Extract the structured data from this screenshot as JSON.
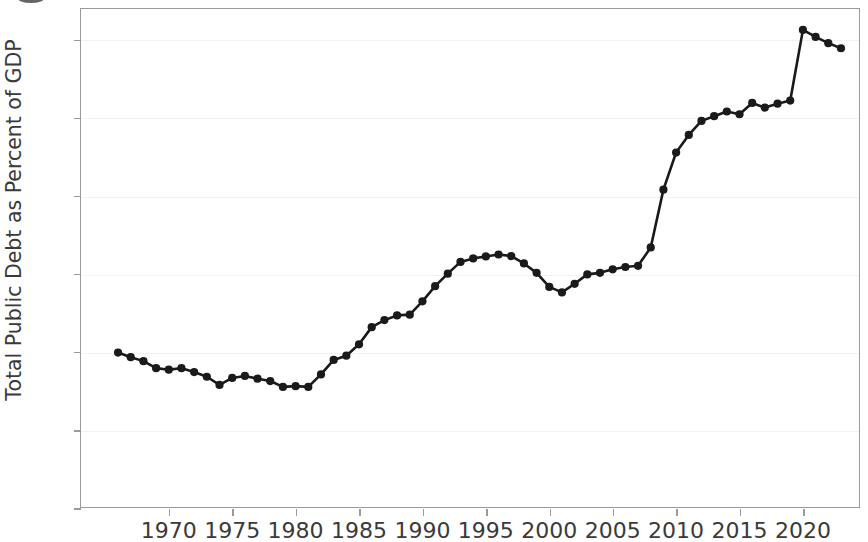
{
  "chart_data": {
    "type": "line",
    "title": "",
    "subtitle": "",
    "xlabel": "",
    "ylabel": "Total Public Debt as Percent of GDP",
    "xlim": [
      1963.0,
      2024.5
    ],
    "ylim": [
      0,
      128
    ],
    "xticks": [
      1970,
      1975,
      1980,
      1985,
      1990,
      1995,
      2000,
      2005,
      2010,
      2015,
      2020
    ],
    "xtick_labels": [
      "1970",
      "1975",
      "1980",
      "1985",
      "1990",
      "1995",
      "2000",
      "2005",
      "2010",
      "2015",
      "2020"
    ],
    "yticks": [
      0,
      20,
      40,
      60,
      80,
      100,
      120
    ],
    "ytick_labels": [
      "0",
      "20",
      "40",
      "60",
      "80",
      "100",
      "120"
    ],
    "grid": true,
    "grid_axis": "y",
    "legend": false,
    "legend_position": "none",
    "marker": "circle",
    "line_color": "#1a1a1a",
    "marker_color": "#1a1a1a",
    "series": [
      {
        "name": "Total Public Debt as Percent of GDP",
        "x": [
          1966,
          1967,
          1968,
          1969,
          1970,
          1971,
          1972,
          1973,
          1974,
          1975,
          1976,
          1977,
          1978,
          1979,
          1980,
          1981,
          1982,
          1983,
          1984,
          1985,
          1986,
          1987,
          1988,
          1989,
          1990,
          1991,
          1992,
          1993,
          1994,
          1995,
          1996,
          1997,
          1998,
          1999,
          2000,
          2001,
          2002,
          2003,
          2004,
          2005,
          2006,
          2007,
          2008,
          2009,
          2010,
          2011,
          2012,
          2013,
          2014,
          2015,
          2016,
          2017,
          2018,
          2019,
          2020,
          2021,
          2022,
          2023
        ],
        "values": [
          39.8,
          38.6,
          37.6,
          35.8,
          35.4,
          35.8,
          34.8,
          33.6,
          31.5,
          33.3,
          33.8,
          33.1,
          32.5,
          31.0,
          31.2,
          31.0,
          34.2,
          37.9,
          39.0,
          41.9,
          46.3,
          48.1,
          49.3,
          49.5,
          52.9,
          56.8,
          60.0,
          63.0,
          63.9,
          64.4,
          64.9,
          64.5,
          62.6,
          60.2,
          56.6,
          55.2,
          57.4,
          59.8,
          60.2,
          61.1,
          61.7,
          62.0,
          66.7,
          81.5,
          91.0,
          95.5,
          99.1,
          100.3,
          101.5,
          100.8,
          103.7,
          102.5,
          103.5,
          104.3,
          122.4,
          120.6,
          119.0,
          117.7
        ]
      }
    ]
  },
  "axis": {
    "y_label": "Total Public Debt as Percent of GDP"
  }
}
